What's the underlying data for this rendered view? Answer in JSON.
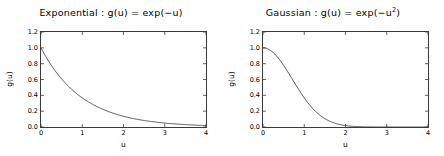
{
  "figure": {
    "background": "#ffffff",
    "axis_color": "#3a3a3a",
    "line_color": "#404040"
  },
  "panels": [
    {
      "id": "exponential",
      "title_prefix": "Exponential : g(u) = exp(−u)",
      "title_sup": "",
      "xlabel": "u",
      "ylabel": "g(u)",
      "xticks": [
        "0",
        "1",
        "2",
        "3",
        "4"
      ],
      "yticks": [
        "1.2",
        "1.0",
        "0.8",
        "0.6",
        "0.4",
        "0.2",
        "0.0"
      ]
    },
    {
      "id": "gaussian",
      "title_prefix": "Gaussian : g(u) = exp(−u",
      "title_sup": "2",
      "title_suffix": ")",
      "xlabel": "u",
      "ylabel": "g(u)",
      "xticks": [
        "0",
        "1",
        "2",
        "3",
        "4"
      ],
      "yticks": [
        "1.2",
        "1.0",
        "0.8",
        "0.6",
        "0.4",
        "0.2",
        "0.0"
      ]
    }
  ],
  "chart_data": [
    {
      "type": "line",
      "title": "Exponential : g(u) = exp(-u)",
      "xlabel": "u",
      "ylabel": "g(u)",
      "xlim": [
        0,
        4
      ],
      "ylim": [
        0,
        1.2
      ],
      "xticks": [
        0,
        1,
        2,
        3,
        4
      ],
      "yticks": [
        0.0,
        0.2,
        0.4,
        0.6,
        0.8,
        1.0,
        1.2
      ],
      "grid": false,
      "legend": null,
      "series": [
        {
          "name": "exp(-u)",
          "x": [
            0,
            0.2,
            0.4,
            0.6,
            0.8,
            1.0,
            1.2,
            1.4,
            1.6,
            1.8,
            2.0,
            2.2,
            2.4,
            2.6,
            2.8,
            3.0,
            3.2,
            3.4,
            3.6,
            3.8,
            4.0
          ],
          "y": [
            1.0,
            0.8187,
            0.6703,
            0.5488,
            0.4493,
            0.3679,
            0.3012,
            0.2466,
            0.2019,
            0.1653,
            0.1353,
            0.1108,
            0.0907,
            0.0743,
            0.0608,
            0.0498,
            0.0408,
            0.0334,
            0.0273,
            0.0224,
            0.0183
          ]
        }
      ]
    },
    {
      "type": "line",
      "title": "Gaussian : g(u) = exp(-u^2)",
      "xlabel": "u",
      "ylabel": "g(u)",
      "xlim": [
        0,
        4
      ],
      "ylim": [
        0,
        1.2
      ],
      "xticks": [
        0,
        1,
        2,
        3,
        4
      ],
      "yticks": [
        0.0,
        0.2,
        0.4,
        0.6,
        0.8,
        1.0,
        1.2
      ],
      "grid": false,
      "legend": null,
      "series": [
        {
          "name": "exp(-u^2)",
          "x": [
            0,
            0.2,
            0.4,
            0.6,
            0.8,
            1.0,
            1.2,
            1.4,
            1.6,
            1.8,
            2.0,
            2.2,
            2.4,
            2.6,
            2.8,
            3.0,
            3.2,
            3.4,
            3.6,
            3.8,
            4.0
          ],
          "y": [
            1.0,
            0.9608,
            0.8521,
            0.6977,
            0.5273,
            0.3679,
            0.2369,
            0.1409,
            0.0773,
            0.0392,
            0.0183,
            0.0079,
            0.0032,
            0.0012,
            0.0004,
            0.0001,
            0.0,
            0.0,
            0.0,
            0.0,
            0.0
          ]
        }
      ]
    }
  ]
}
